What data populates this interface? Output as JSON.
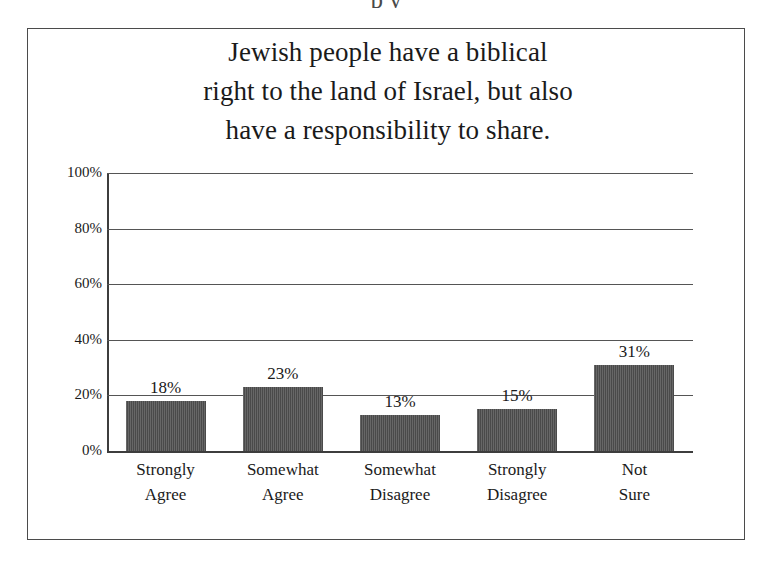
{
  "top_clipped_text": "p y",
  "figure": {
    "title_lines": [
      "Jewish people have a biblical",
      "right to the land of Israel, but also",
      "have a responsibility to share."
    ]
  },
  "chart_data": {
    "type": "bar",
    "categories": [
      "Strongly Agree",
      "Somewhat Agree",
      "Somewhat Disagree",
      "Strongly Disagree",
      "Not Sure"
    ],
    "category_lines": [
      [
        "Strongly",
        "Agree"
      ],
      [
        "Somewhat",
        "Agree"
      ],
      [
        "Somewhat",
        "Disagree"
      ],
      [
        "Strongly",
        "Disagree"
      ],
      [
        "Not",
        "Sure"
      ]
    ],
    "values": [
      18,
      23,
      13,
      15,
      31
    ],
    "value_labels": [
      "18%",
      "23%",
      "13%",
      "15%",
      "31%"
    ],
    "xlabel": "",
    "ylabel": "",
    "ylim": [
      0,
      100
    ],
    "ytick_values": [
      100,
      80,
      60,
      40,
      20,
      0
    ],
    "ytick_labels": [
      "100%",
      "80%",
      "60%",
      "40%",
      "20%",
      "0%"
    ],
    "grid": true,
    "legend": false,
    "bar_color": "#4a4a4a",
    "axis_color": "#3d3d3d",
    "gridline_color": "#555555",
    "background_color": "#ffffff",
    "border_color": "#4b4b4b"
  }
}
